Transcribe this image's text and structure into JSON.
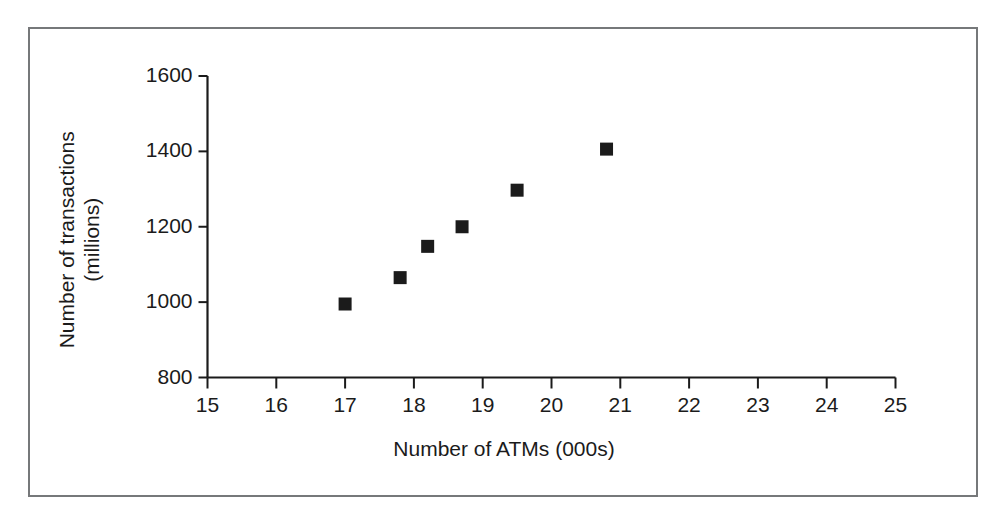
{
  "figure": {
    "background_color": "#ffffff",
    "frame_color": "#76787a",
    "axis_color": "#1b1b1b",
    "marker_color": "#1b1b1b"
  },
  "chart_data": {
    "type": "scatter",
    "title": "",
    "subtitle": "",
    "xlabel": "Number of ATMs (000s)",
    "ylabel": "Number of transactions (millions)",
    "ylabel_line1": "Number of transactions",
    "ylabel_line2": "(millions)",
    "xlim": [
      15,
      25
    ],
    "ylim": [
      800,
      1600
    ],
    "xticks": [
      15,
      16,
      17,
      18,
      19,
      20,
      21,
      22,
      23,
      24,
      25
    ],
    "yticks": [
      800,
      1000,
      1200,
      1400,
      1600
    ],
    "xtick_labels": [
      "15",
      "16",
      "17",
      "18",
      "19",
      "20",
      "21",
      "22",
      "23",
      "24",
      "25"
    ],
    "ytick_labels": [
      "800",
      "1000",
      "1200",
      "1400",
      "1600"
    ],
    "grid": false,
    "legend": null,
    "marker": "square",
    "marker_size": 13,
    "points": [
      {
        "x": 17.0,
        "y": 995
      },
      {
        "x": 17.8,
        "y": 1065
      },
      {
        "x": 18.2,
        "y": 1148
      },
      {
        "x": 18.7,
        "y": 1200
      },
      {
        "x": 19.5,
        "y": 1297
      },
      {
        "x": 20.8,
        "y": 1406
      }
    ]
  }
}
